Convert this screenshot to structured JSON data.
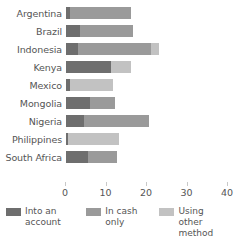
{
  "chart_data": {
    "type": "bar",
    "orientation": "horizontal",
    "stacked": true,
    "title": "",
    "xlabel": "",
    "ylabel": "",
    "xlim": [
      0,
      40
    ],
    "xticks": [
      0,
      10,
      20,
      30,
      40
    ],
    "xtick_labels": [
      "0",
      "10",
      "20",
      "30",
      "40"
    ],
    "grid": false,
    "legend_position": "bottom",
    "categories": [
      "Argentina",
      "Brazil",
      "Indonesia",
      "Kenya",
      "Mexico",
      "Mongolia",
      "Nigeria",
      "Philippines",
      "South Africa"
    ],
    "series": [
      {
        "name": "Into an account",
        "color": "#6e6e6e",
        "values": [
          1.0,
          3.5,
          3.0,
          11.0,
          1.0,
          6.0,
          4.5,
          0.5,
          5.5
        ]
      },
      {
        "name": "In cash only",
        "color": "#9a9a9a",
        "values": [
          15.0,
          13.0,
          18.0,
          0.0,
          0.0,
          6.0,
          16.0,
          0.0,
          7.0
        ]
      },
      {
        "name": "Using other method",
        "color": "#c2c2c2",
        "values": [
          0.0,
          0.0,
          2.0,
          5.0,
          10.5,
          0.0,
          0.0,
          12.5,
          0.0
        ]
      }
    ],
    "totals": [
      16.0,
      16.5,
      23.0,
      16.0,
      11.5,
      12.0,
      20.5,
      13.0,
      12.5
    ]
  },
  "legend": {
    "items": [
      {
        "label": "Into an account",
        "color": "#6e6e6e"
      },
      {
        "label": "In cash only",
        "color": "#9a9a9a"
      },
      {
        "label": "Using other method",
        "color": "#c2c2c2"
      }
    ]
  },
  "colors": {
    "background": "#ffffff",
    "text": "#555555",
    "tick": "#c8c8c8"
  }
}
